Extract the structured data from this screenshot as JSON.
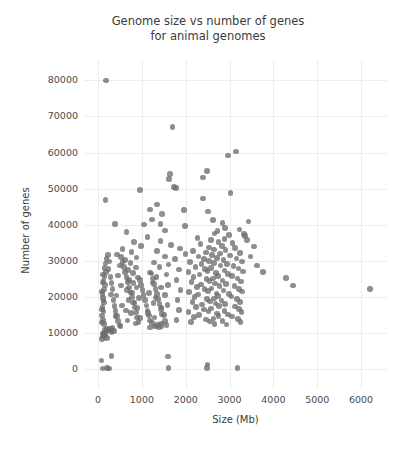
{
  "chart_data": {
    "type": "scatter",
    "title": "Genome size vs number of genes\nfor animal genomes",
    "xlabel": "Size (Mb)",
    "ylabel": "Number of genes",
    "xlim": [
      -230,
      6500
    ],
    "ylim": [
      -4500,
      84000
    ],
    "xticks": [
      0,
      1000,
      2000,
      3000,
      4000,
      5000,
      6000
    ],
    "xtick_labels": [
      "0",
      "1000",
      "2000",
      "3000",
      "4000",
      "5000",
      "6000"
    ],
    "yticks": [
      0,
      10000,
      20000,
      30000,
      40000,
      50000,
      60000,
      70000,
      80000
    ],
    "ytick_labels": [
      "0",
      "10000",
      "20000",
      "30000",
      "40000",
      "50000",
      "60000",
      "70000",
      "80000"
    ],
    "grid": true,
    "legend": null,
    "marker": {
      "color": "#6e6e6e",
      "size": 5.6,
      "opacity": 0.78,
      "shape": "circle"
    },
    "points": [
      [
        180,
        80000
      ],
      [
        1700,
        67000
      ],
      [
        3150,
        60300
      ],
      [
        2960,
        59200
      ],
      [
        2480,
        54800
      ],
      [
        1640,
        54000
      ],
      [
        1620,
        52600
      ],
      [
        2390,
        53100
      ],
      [
        1730,
        50400
      ],
      [
        1780,
        50100
      ],
      [
        950,
        49600
      ],
      [
        3020,
        48700
      ],
      [
        170,
        46900
      ],
      [
        2400,
        47200
      ],
      [
        1340,
        45600
      ],
      [
        1180,
        44200
      ],
      [
        1960,
        44000
      ],
      [
        2510,
        43600
      ],
      [
        1460,
        43000
      ],
      [
        1230,
        41400
      ],
      [
        3430,
        40900
      ],
      [
        2620,
        41200
      ],
      [
        2840,
        40500
      ],
      [
        1420,
        40100
      ],
      [
        1050,
        40000
      ],
      [
        390,
        40100
      ],
      [
        1980,
        39600
      ],
      [
        2900,
        39100
      ],
      [
        3230,
        38600
      ],
      [
        1530,
        38400
      ],
      [
        2720,
        38300
      ],
      [
        650,
        38000
      ],
      [
        2660,
        37500
      ],
      [
        3350,
        36900
      ],
      [
        2990,
        37100
      ],
      [
        1130,
        36500
      ],
      [
        2270,
        36200
      ],
      [
        2880,
        36000
      ],
      [
        2580,
        35700
      ],
      [
        1420,
        35400
      ],
      [
        820,
        35100
      ],
      [
        2750,
        35200
      ],
      [
        3070,
        34900
      ],
      [
        2340,
        34600
      ],
      [
        1660,
        34300
      ],
      [
        980,
        34100
      ],
      [
        2830,
        34000
      ],
      [
        2530,
        33700
      ],
      [
        3120,
        33500
      ],
      [
        1870,
        33400
      ],
      [
        560,
        33200
      ],
      [
        2640,
        33100
      ],
      [
        2910,
        32900
      ],
      [
        2170,
        32700
      ],
      [
        1340,
        32600
      ],
      [
        760,
        32400
      ],
      [
        2460,
        32300
      ],
      [
        3240,
        32100
      ],
      [
        2780,
        32000
      ],
      [
        1990,
        31800
      ],
      [
        430,
        31700
      ],
      [
        2600,
        31500
      ],
      [
        3010,
        31400
      ],
      [
        2290,
        31200
      ],
      [
        1520,
        31100
      ],
      [
        880,
        30900
      ],
      [
        2710,
        30800
      ],
      [
        3160,
        30600
      ],
      [
        2410,
        30500
      ],
      [
        1760,
        30400
      ],
      [
        620,
        30200
      ],
      [
        2860,
        30100
      ],
      [
        2530,
        29900
      ],
      [
        3280,
        29800
      ],
      [
        2100,
        29700
      ],
      [
        1270,
        29500
      ],
      [
        740,
        29400
      ],
      [
        2650,
        29300
      ],
      [
        2940,
        29100
      ],
      [
        2360,
        29000
      ],
      [
        1610,
        28900
      ],
      [
        500,
        28700
      ],
      [
        2790,
        28600
      ],
      [
        3090,
        28500
      ],
      [
        2220,
        28300
      ],
      [
        1400,
        28200
      ],
      [
        860,
        28100
      ],
      [
        2580,
        27900
      ],
      [
        3200,
        27800
      ],
      [
        2440,
        27700
      ],
      [
        1850,
        27500
      ],
      [
        680,
        27400
      ],
      [
        2880,
        27300
      ],
      [
        2500,
        27100
      ],
      [
        3310,
        27000
      ],
      [
        2060,
        26900
      ],
      [
        1190,
        26700
      ],
      [
        790,
        26600
      ],
      [
        2690,
        26500
      ],
      [
        2970,
        26300
      ],
      [
        2310,
        26200
      ],
      [
        1560,
        26100
      ],
      [
        450,
        25900
      ],
      [
        2740,
        25800
      ],
      [
        3050,
        25700
      ],
      [
        2180,
        25500
      ],
      [
        1330,
        25400
      ],
      [
        910,
        25300
      ],
      [
        2620,
        25100
      ],
      [
        3180,
        25000
      ],
      [
        2470,
        24900
      ],
      [
        1790,
        24700
      ],
      [
        710,
        24600
      ],
      [
        2840,
        24500
      ],
      [
        2540,
        24300
      ],
      [
        3260,
        24200
      ],
      [
        2130,
        24100
      ],
      [
        1240,
        23900
      ],
      [
        810,
        23800
      ],
      [
        2670,
        23700
      ],
      [
        2920,
        23500
      ],
      [
        2350,
        23400
      ],
      [
        1600,
        23300
      ],
      [
        520,
        23100
      ],
      [
        2770,
        23000
      ],
      [
        3110,
        22900
      ],
      [
        2250,
        22700
      ],
      [
        1430,
        22600
      ],
      [
        880,
        22500
      ],
      [
        2590,
        22300
      ],
      [
        3220,
        22200
      ],
      [
        2430,
        22100
      ],
      [
        1880,
        21900
      ],
      [
        660,
        21800
      ],
      [
        2860,
        21700
      ],
      [
        2510,
        21500
      ],
      [
        3290,
        21400
      ],
      [
        2080,
        21300
      ],
      [
        1160,
        21100
      ],
      [
        770,
        21000
      ],
      [
        2700,
        20900
      ],
      [
        2990,
        20700
      ],
      [
        2280,
        20600
      ],
      [
        1530,
        20500
      ],
      [
        420,
        20300
      ],
      [
        2730,
        20200
      ],
      [
        3040,
        20100
      ],
      [
        2200,
        19900
      ],
      [
        1310,
        19800
      ],
      [
        930,
        19700
      ],
      [
        2640,
        19500
      ],
      [
        3170,
        19400
      ],
      [
        2490,
        19300
      ],
      [
        1810,
        19100
      ],
      [
        690,
        19000
      ],
      [
        2820,
        18900
      ],
      [
        2550,
        18700
      ],
      [
        3240,
        18600
      ],
      [
        2150,
        18500
      ],
      [
        1260,
        18300
      ],
      [
        830,
        18200
      ],
      [
        2680,
        18100
      ],
      [
        2900,
        17900
      ],
      [
        2370,
        17800
      ],
      [
        1580,
        17700
      ],
      [
        540,
        17500
      ],
      [
        2760,
        17400
      ],
      [
        3130,
        17300
      ],
      [
        2230,
        17100
      ],
      [
        1450,
        17000
      ],
      [
        900,
        16900
      ],
      [
        2570,
        16700
      ],
      [
        3210,
        16600
      ],
      [
        2410,
        16500
      ],
      [
        1840,
        16300
      ],
      [
        640,
        16200
      ],
      [
        2880,
        16100
      ],
      [
        2520,
        15900
      ],
      [
        3270,
        15800
      ],
      [
        2060,
        15700
      ],
      [
        1140,
        15500
      ],
      [
        750,
        15400
      ],
      [
        2710,
        15300
      ],
      [
        2960,
        15100
      ],
      [
        2300,
        15000
      ],
      [
        1510,
        14900
      ],
      [
        400,
        14700
      ],
      [
        2750,
        14600
      ],
      [
        3060,
        14500
      ],
      [
        2190,
        14300
      ],
      [
        1290,
        14200
      ],
      [
        950,
        14100
      ],
      [
        2630,
        13900
      ],
      [
        3190,
        13800
      ],
      [
        2460,
        13700
      ],
      [
        1790,
        13500
      ],
      [
        670,
        13400
      ],
      [
        2840,
        13300
      ],
      [
        2560,
        13100
      ],
      [
        3250,
        13000
      ],
      [
        2120,
        12900
      ],
      [
        1230,
        12700
      ],
      [
        850,
        12600
      ],
      [
        2660,
        12500
      ],
      [
        2930,
        12300
      ],
      [
        1350,
        12200
      ],
      [
        1560,
        12100
      ],
      [
        510,
        11900
      ],
      [
        1450,
        11800
      ],
      [
        1300,
        11700
      ],
      [
        1180,
        11500
      ],
      [
        1390,
        11400
      ],
      [
        330,
        11300
      ],
      [
        270,
        11100
      ],
      [
        210,
        11000
      ],
      [
        160,
        10900
      ],
      [
        290,
        10700
      ],
      [
        240,
        10600
      ],
      [
        360,
        10500
      ],
      [
        190,
        10300
      ],
      [
        310,
        10200
      ],
      [
        140,
        10100
      ],
      [
        1440,
        12600
      ],
      [
        1520,
        13200
      ],
      [
        100,
        9800
      ],
      [
        130,
        9500
      ],
      [
        170,
        9300
      ],
      [
        110,
        9000
      ],
      [
        150,
        8700
      ],
      [
        200,
        8500
      ],
      [
        90,
        8300
      ],
      [
        130,
        12400
      ],
      [
        110,
        13600
      ],
      [
        95,
        14800
      ],
      [
        120,
        15900
      ],
      [
        105,
        17200
      ],
      [
        140,
        18400
      ],
      [
        115,
        19600
      ],
      [
        100,
        20800
      ],
      [
        135,
        22000
      ],
      [
        160,
        23200
      ],
      [
        125,
        24400
      ],
      [
        150,
        25600
      ],
      [
        180,
        26800
      ],
      [
        145,
        28000
      ],
      [
        170,
        29200
      ],
      [
        195,
        30400
      ],
      [
        230,
        31600
      ],
      [
        260,
        29800
      ],
      [
        240,
        27600
      ],
      [
        280,
        25400
      ],
      [
        310,
        23800
      ],
      [
        330,
        22200
      ],
      [
        290,
        20600
      ],
      [
        350,
        19000
      ],
      [
        370,
        17400
      ],
      [
        400,
        16000
      ],
      [
        430,
        14600
      ],
      [
        460,
        13200
      ],
      [
        490,
        12000
      ],
      [
        520,
        31000
      ],
      [
        560,
        29600
      ],
      [
        590,
        28200
      ],
      [
        620,
        26800
      ],
      [
        650,
        25400
      ],
      [
        680,
        24000
      ],
      [
        710,
        22600
      ],
      [
        740,
        21200
      ],
      [
        770,
        19800
      ],
      [
        800,
        18400
      ],
      [
        830,
        17000
      ],
      [
        860,
        15600
      ],
      [
        890,
        14200
      ],
      [
        920,
        13000
      ],
      [
        950,
        24600
      ],
      [
        980,
        23200
      ],
      [
        1010,
        21800
      ],
      [
        1040,
        20400
      ],
      [
        1070,
        19000
      ],
      [
        1100,
        17600
      ],
      [
        1130,
        16200
      ],
      [
        1160,
        14800
      ],
      [
        1190,
        13400
      ],
      [
        1220,
        26400
      ],
      [
        1250,
        25000
      ],
      [
        1280,
        23600
      ],
      [
        1310,
        22200
      ],
      [
        1340,
        20800
      ],
      [
        1370,
        19400
      ],
      [
        1400,
        18000
      ],
      [
        1430,
        16600
      ],
      [
        1460,
        15200
      ],
      [
        310,
        3600
      ],
      [
        80,
        2300
      ],
      [
        100,
        100
      ],
      [
        200,
        150
      ],
      [
        250,
        120
      ],
      [
        1600,
        3400
      ],
      [
        1610,
        200
      ],
      [
        2480,
        250
      ],
      [
        2500,
        1200
      ],
      [
        3180,
        180
      ],
      [
        4290,
        25200
      ],
      [
        4450,
        23100
      ],
      [
        6210,
        22200
      ],
      [
        3560,
        33900
      ],
      [
        3620,
        28700
      ],
      [
        3760,
        26900
      ],
      [
        3480,
        31200
      ],
      [
        3400,
        35800
      ],
      [
        3330,
        37400
      ],
      [
        85,
        16500
      ],
      [
        95,
        21400
      ],
      [
        105,
        23900
      ],
      [
        115,
        26200
      ],
      [
        125,
        18900
      ],
      [
        90,
        12800
      ]
    ]
  }
}
